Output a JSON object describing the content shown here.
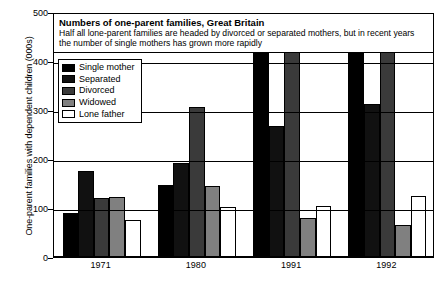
{
  "chart_data": {
    "type": "bar",
    "title": "Numbers of one-parent families, Great Britain",
    "subtitle": "Half all lone-parent families are headed by divorced or separated mothers, but in recent years the number of single mothers has grown more rapidly",
    "xlabel": "",
    "ylabel": "One-parent families with dependent children (000s)",
    "categories": [
      "1971",
      "1980",
      "1991",
      "1992"
    ],
    "ylim": [
      0,
      500
    ],
    "yticks": [
      0,
      100,
      200,
      300,
      400,
      500
    ],
    "ytick_labels": [
      "0",
      "100",
      "200",
      "300",
      "400",
      "500"
    ],
    "grid": true,
    "legend_position": "top-left-inside",
    "series": [
      {
        "name": "Single mother",
        "color": "#000000",
        "values": [
          90,
          146,
          452,
          497
        ]
      },
      {
        "name": "Separated",
        "color": "#111111",
        "values": [
          175,
          192,
          268,
          313
        ]
      },
      {
        "name": "Divorced",
        "color": "#3a3a3a",
        "values": [
          120,
          307,
          438,
          440
        ]
      },
      {
        "name": "Widowed",
        "color": "#808080",
        "values": [
          122,
          145,
          80,
          65
        ]
      },
      {
        "name": "Lone father",
        "color": "#ffffff",
        "values": [
          75,
          103,
          105,
          125
        ]
      }
    ]
  },
  "axis": {
    "y_title": "One-parent families with dependent children (000s)"
  }
}
